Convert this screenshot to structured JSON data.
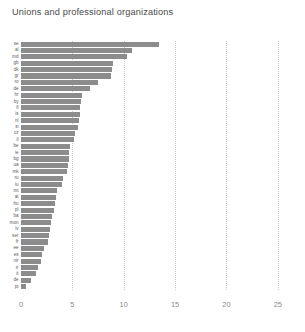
{
  "chart_data": {
    "type": "bar",
    "orientation": "horizontal",
    "title": "Unions and professional organizations",
    "xlabel": "",
    "ylabel": "",
    "xlim": [
      0,
      25.5
    ],
    "xticks": [
      "0",
      "5",
      "10",
      "15",
      "20",
      "25"
    ],
    "xtick_values": [
      0,
      5,
      10,
      15,
      20,
      25
    ],
    "gridlines": [
      5,
      10,
      15,
      20,
      25
    ],
    "grid": true,
    "legend": null,
    "bar_color": "#8c8c8c",
    "categories": [
      "se",
      "al",
      "md",
      "gb",
      "dk",
      "gr",
      "ro",
      "de",
      "hr",
      "by",
      "fi",
      "is",
      "nl",
      "si",
      "cz",
      "il",
      "be",
      "ie",
      "bg",
      "ua",
      "mk",
      "ru",
      "lu",
      "mt",
      "at",
      "hu",
      "pl",
      "ba",
      "mon",
      "lv",
      "ser",
      "fr",
      "ee",
      "es",
      "nir",
      "tr",
      "it",
      "dk2",
      "pt"
    ],
    "values": [
      13.4,
      10.8,
      10.3,
      9.0,
      8.9,
      8.8,
      7.5,
      6.7,
      5.9,
      5.8,
      5.75,
      5.7,
      5.6,
      5.5,
      5.3,
      5.2,
      4.8,
      4.7,
      4.65,
      4.6,
      4.5,
      4.1,
      4.0,
      3.5,
      3.4,
      3.3,
      3.2,
      3.0,
      2.95,
      2.8,
      2.7,
      2.6,
      2.2,
      2.0,
      1.9,
      1.7,
      1.5,
      1.0,
      0.5
    ],
    "bars": [
      {
        "label": "se",
        "value": 13.4
      },
      {
        "label": "al",
        "value": 10.8
      },
      {
        "label": "md",
        "value": 10.3
      },
      {
        "label": "gb",
        "value": 9.0
      },
      {
        "label": "dk",
        "value": 8.9
      },
      {
        "label": "gr",
        "value": 8.8
      },
      {
        "label": "ro",
        "value": 7.5
      },
      {
        "label": "de",
        "value": 6.7
      },
      {
        "label": "hr",
        "value": 5.9
      },
      {
        "label": "by",
        "value": 5.8
      },
      {
        "label": "fi",
        "value": 5.75
      },
      {
        "label": "is",
        "value": 5.7
      },
      {
        "label": "nl",
        "value": 5.6
      },
      {
        "label": "si",
        "value": 5.5
      },
      {
        "label": "cz",
        "value": 5.3
      },
      {
        "label": "il",
        "value": 5.2
      },
      {
        "label": "be",
        "value": 4.8
      },
      {
        "label": "ie",
        "value": 4.7
      },
      {
        "label": "bg",
        "value": 4.65
      },
      {
        "label": "ua",
        "value": 4.6
      },
      {
        "label": "mk",
        "value": 4.5
      },
      {
        "label": "ru",
        "value": 4.1
      },
      {
        "label": "lu",
        "value": 4.0
      },
      {
        "label": "mt",
        "value": 3.5
      },
      {
        "label": "at",
        "value": 3.4
      },
      {
        "label": "hu",
        "value": 3.3
      },
      {
        "label": "pl",
        "value": 3.2
      },
      {
        "label": "ba",
        "value": 3.0
      },
      {
        "label": "mon",
        "value": 2.95
      },
      {
        "label": "lv",
        "value": 2.8
      },
      {
        "label": "ser",
        "value": 2.7
      },
      {
        "label": "fr",
        "value": 2.6
      },
      {
        "label": "ee",
        "value": 2.2
      },
      {
        "label": "es",
        "value": 2.0
      },
      {
        "label": "nir",
        "value": 1.9
      },
      {
        "label": "tr",
        "value": 1.7
      },
      {
        "label": "it",
        "value": 1.5
      },
      {
        "label": "de",
        "value": 1.0
      },
      {
        "label": "pt",
        "value": 0.5
      }
    ]
  }
}
